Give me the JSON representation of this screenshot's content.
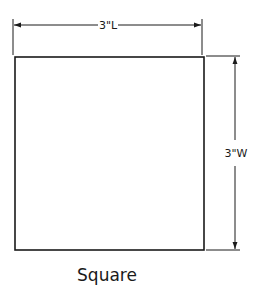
{
  "diagram": {
    "shape_name": "Square",
    "length_label": "3\"L",
    "width_label": "3\"W",
    "line_color": "#1a1a1a",
    "background": "#ffffff"
  }
}
